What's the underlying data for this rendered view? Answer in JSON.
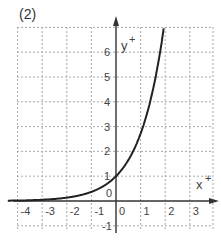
{
  "panel_label": "(2)",
  "chart_data": {
    "type": "line",
    "title": "(2)",
    "xlabel": "x",
    "ylabel": "y",
    "function": "y = e^x",
    "xlim": [
      -4.4,
      3.9
    ],
    "ylim": [
      -1,
      7
    ],
    "grid": true,
    "grid_style": "dashed",
    "x_ticks": [
      -4,
      -3,
      -2,
      -1,
      0,
      1,
      2,
      3
    ],
    "y_ticks": [
      -1,
      0,
      1,
      2,
      3,
      4,
      5,
      6
    ],
    "x_tick_labels": [
      "-4",
      "-3",
      "-2",
      "-1",
      "0",
      "1",
      "2",
      "3"
    ],
    "y_tick_labels": [
      "-1",
      "0",
      "1",
      "2",
      "3",
      "4",
      "5",
      "6"
    ],
    "series": [
      {
        "name": "curve",
        "x": [
          -4.4,
          -4,
          -3,
          -2,
          -1,
          0,
          0.5,
          1,
          1.5,
          1.8,
          1.95
        ],
        "y": [
          0.012,
          0.018,
          0.05,
          0.135,
          0.368,
          1,
          1.65,
          2.72,
          4.48,
          6.05,
          7.0
        ]
      }
    ],
    "colors": {
      "curve": "#222222",
      "grid": "#aaaaaa",
      "axis": "#333333"
    }
  }
}
